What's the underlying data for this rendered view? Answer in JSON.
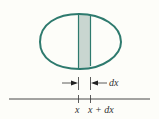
{
  "diagram": {
    "labels": {
      "x": "x",
      "x_plus_dx": "x + dx",
      "width": "dx"
    },
    "colors": {
      "outline": "#2e7a6e",
      "strip_fill": "#c9d6d0",
      "axis": "#333333"
    }
  }
}
